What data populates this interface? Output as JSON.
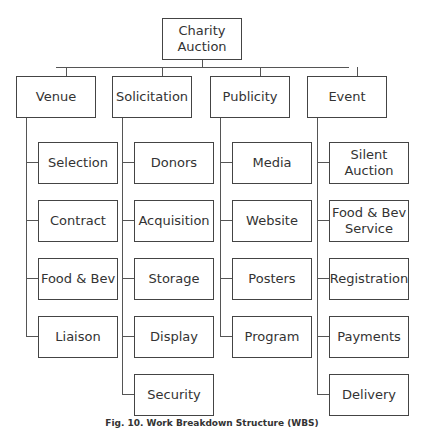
{
  "root": {
    "label": "Charity\nAuction"
  },
  "branches": [
    {
      "label": "Venue",
      "children": [
        "Selection",
        "Contract",
        "Food & Bev",
        "Liaison"
      ]
    },
    {
      "label": "Solicitation",
      "children": [
        "Donors",
        "Acquisition",
        "Storage",
        "Display",
        "Security"
      ]
    },
    {
      "label": "Publicity",
      "children": [
        "Media",
        "Website",
        "Posters",
        "Program"
      ]
    },
    {
      "label": "Event",
      "children": [
        "Silent\nAuction",
        "Food & Bev\nService",
        "Registration",
        "Payments",
        "Delivery"
      ]
    }
  ],
  "caption": "Fig. 10. Work Breakdown Structure (WBS)"
}
